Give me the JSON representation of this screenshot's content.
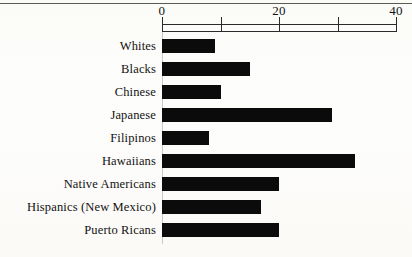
{
  "page": {
    "background_color": "#fdfdfb",
    "ink_color": "#0b0b0b",
    "rule_color": "#3c3c3c"
  },
  "chart_data": {
    "type": "bar",
    "orientation": "horizontal",
    "title": "",
    "subtitle": "",
    "xlabel": "",
    "ylabel": "",
    "xlim": [
      0,
      40
    ],
    "axis_position": "top",
    "grid": false,
    "legend": null,
    "tick_values": [
      0,
      10,
      20,
      30,
      40
    ],
    "tick_labels": [
      "0",
      "",
      "20",
      "",
      "40"
    ],
    "bar_color": "#0b0b0b",
    "categories": [
      "Whites",
      "Blacks",
      "Chinese",
      "Japanese",
      "Filipinos",
      "Hawaiians",
      "Native Americans",
      "Hispanics (New Mexico)",
      "Puerto Ricans"
    ],
    "values": [
      9,
      15,
      10,
      29,
      8,
      33,
      20,
      17,
      20
    ]
  }
}
